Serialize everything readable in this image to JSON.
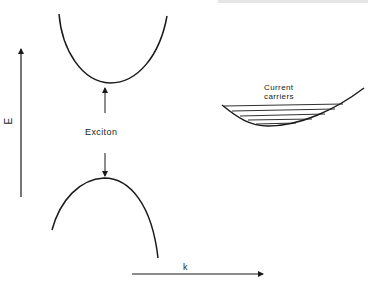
{
  "diagram": {
    "title": "",
    "colors": {
      "stroke": "#1a1a1a",
      "background": "#ffffff"
    },
    "axes": {
      "y_label": "E",
      "x_label": "k"
    },
    "labels": {
      "exciton": "Exciton",
      "current_carriers_line1": "Current",
      "current_carriers_line2": "carriers"
    },
    "elements": [
      {
        "id": "conduction-band",
        "shape": "upward parabola",
        "vertex": [
          110,
          83
        ]
      },
      {
        "id": "valence-band",
        "shape": "downward parabola",
        "vertex": [
          103,
          178
        ]
      },
      {
        "id": "exciton-arrow-up",
        "from": [
          105,
          110
        ],
        "to": [
          105,
          88
        ]
      },
      {
        "id": "exciton-arrow-down",
        "from": [
          105,
          158
        ],
        "to": [
          105,
          176
        ]
      },
      {
        "id": "carrier-band",
        "shape": "shallow upward parabola with filled horizontal levels",
        "levels": 5
      },
      {
        "id": "energy-axis",
        "direction": "up"
      },
      {
        "id": "momentum-axis",
        "direction": "right"
      }
    ]
  }
}
